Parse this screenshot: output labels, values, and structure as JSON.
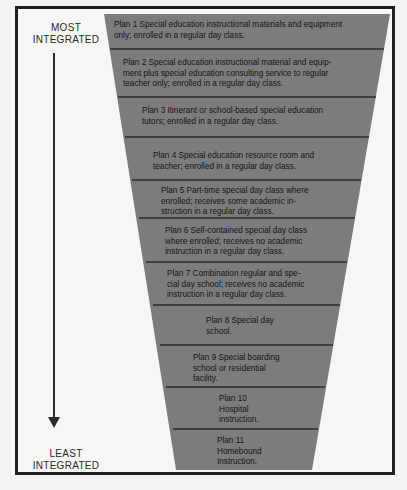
{
  "axis": {
    "top_label_line1": "MOST",
    "top_label_line2": "INTEGRATED",
    "bottom_label_line1": "LEAST",
    "bottom_label_line2": "INTEGRATED",
    "direction": "down"
  },
  "colors": {
    "funnel_fill": "#7c7c7c",
    "separator": "#2b2b2b",
    "frame": "#1f1f1f",
    "background": "#f6f6f4"
  },
  "plans": [
    {
      "number": 1,
      "lines": [
        "Plan 1 Special education instructional materials and equipment",
        "only; enrolled in a regular day class."
      ]
    },
    {
      "number": 2,
      "lines": [
        "Plan 2 Special education instructional material and equip-",
        "ment plus special education consulting service to regular",
        "teacher only; enrolled in a regular day class."
      ]
    },
    {
      "number": 3,
      "lines": [
        "Plan 3 Itinerant or school-based special education",
        "tutors; enrolled in a regular day class."
      ]
    },
    {
      "number": 4,
      "lines": [
        "Plan 4 Special education resource room and",
        "teacher; enrolled in a regular day class."
      ]
    },
    {
      "number": 5,
      "lines": [
        "Plan 5 Part-time special day class where",
        "enrolled; receives some academic in-",
        "struction in a regular day class."
      ]
    },
    {
      "number": 6,
      "lines": [
        "Plan 6 Self-contained special day class",
        "where enrolled; receives no academic",
        "instruction in a regular day class."
      ]
    },
    {
      "number": 7,
      "lines": [
        "Plan 7 Combination regular and spe-",
        "cial day school; receives no academic",
        "instruction in a regular day class."
      ]
    },
    {
      "number": 8,
      "lines": [
        "Plan 8 Special day",
        "school."
      ]
    },
    {
      "number": 9,
      "lines": [
        "Plan 9 Special boarding",
        "school or residential",
        "facility."
      ]
    },
    {
      "number": 10,
      "lines": [
        "Plan 10",
        "Hospital",
        "instruction."
      ]
    },
    {
      "number": 11,
      "lines": [
        "Plan 11",
        "Homebound",
        "Instruction."
      ]
    }
  ]
}
